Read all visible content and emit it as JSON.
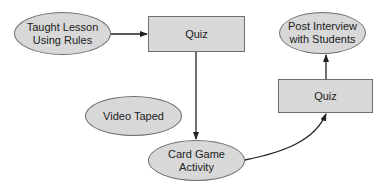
{
  "diagram": {
    "type": "flowchart",
    "colors": {
      "node_fill": "#d8d8d8",
      "node_border": "#6f6f6f",
      "edge": "#222222",
      "text": "#222222",
      "background": "#ffffff"
    },
    "nodes": [
      {
        "id": "taught_lesson",
        "shape": "ellipse",
        "label": "Taught Lesson\nUsing Rules"
      },
      {
        "id": "quiz_1",
        "shape": "rectangle",
        "label": "Quiz"
      },
      {
        "id": "video_taped",
        "shape": "ellipse",
        "label": "Video Taped"
      },
      {
        "id": "card_game",
        "shape": "ellipse",
        "label": "Card Game\nActivity"
      },
      {
        "id": "quiz_2",
        "shape": "rectangle",
        "label": "Quiz"
      },
      {
        "id": "post_interview",
        "shape": "ellipse",
        "label": "Post Interview\nwith Students"
      }
    ],
    "edges": [
      {
        "from": "taught_lesson",
        "to": "quiz_1",
        "style": "straight"
      },
      {
        "from": "quiz_1",
        "to": "card_game",
        "style": "straight"
      },
      {
        "from": "card_game",
        "to": "quiz_2",
        "style": "curved"
      },
      {
        "from": "quiz_2",
        "to": "post_interview",
        "style": "straight"
      }
    ]
  }
}
